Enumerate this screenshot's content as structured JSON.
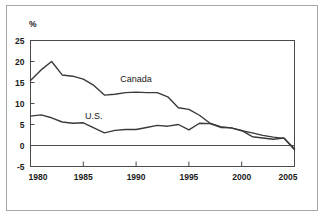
{
  "chart_data": {
    "type": "line",
    "title": "",
    "subtitle": "",
    "xlabel": "",
    "ylabel": "%",
    "unit_label": "%",
    "xlim": [
      1980,
      2005
    ],
    "ylim": [
      -5,
      25
    ],
    "ytick_labels": [
      "25",
      "20",
      "15",
      "10",
      "5",
      "0",
      "-5"
    ],
    "ytick_values": [
      25,
      20,
      15,
      10,
      5,
      0,
      -5
    ],
    "xtick_labels": [
      "1980",
      "1985",
      "1990",
      "1995",
      "2000",
      "2005"
    ],
    "xtick_values": [
      1980,
      1985,
      1990,
      1995,
      2000,
      2005
    ],
    "grid": false,
    "zero_line": true,
    "legend_position": "inline-annotation",
    "x": [
      1980,
      1981,
      1982,
      1983,
      1984,
      1985,
      1986,
      1987,
      1988,
      1989,
      1990,
      1991,
      1992,
      1993,
      1994,
      1995,
      1996,
      1997,
      1998,
      1999,
      2000,
      2001,
      2002,
      2003,
      2004,
      2005
    ],
    "series": [
      {
        "name": "Canada",
        "color": "#3a3a3a",
        "label_x": 1990,
        "label_y": 15.2,
        "values": [
          15.5,
          18.0,
          20.0,
          16.8,
          16.5,
          15.8,
          14.3,
          12.0,
          12.2,
          12.6,
          12.7,
          12.6,
          12.6,
          11.6,
          9.0,
          8.6,
          7.2,
          5.3,
          4.5,
          4.2,
          3.5,
          3.0,
          2.4,
          2.0,
          1.7,
          -0.8
        ]
      },
      {
        "name": "U.S.",
        "color": "#3a3a3a",
        "label_x": 1986,
        "label_y": 6.4,
        "values": [
          7.0,
          7.3,
          6.6,
          5.6,
          5.3,
          5.4,
          4.2,
          3.0,
          3.6,
          3.8,
          3.8,
          4.3,
          4.8,
          4.6,
          5.0,
          3.7,
          5.3,
          5.2,
          4.3,
          4.2,
          3.6,
          2.1,
          1.8,
          1.5,
          1.8,
          -1.0
        ]
      }
    ]
  }
}
